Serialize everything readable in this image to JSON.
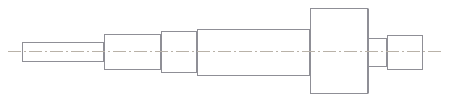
{
  "drawing": {
    "title": "Stepped Shaft",
    "view": "side-elevation",
    "projection": "orthographic",
    "units": "px",
    "canvas": {
      "width": 451,
      "height": 101
    },
    "style": {
      "background": "#ffffff",
      "outline_color": "#8f8f96",
      "centerline_color": "#b9b2a8",
      "line_width": 1,
      "centerline_dash": "13 3 2 3"
    },
    "centerline": {
      "label": "axis-of-revolution",
      "y": 51,
      "x_start": 8,
      "x_end": 441
    },
    "sections": [
      {
        "index": 1,
        "name": "left-end-journal",
        "x_start": 22,
        "x_end": 104,
        "y_top": 42,
        "y_bottom": 62,
        "length": 82,
        "diameter": 20
      },
      {
        "index": 2,
        "name": "second-step",
        "x_start": 104,
        "x_end": 161,
        "y_top": 34,
        "y_bottom": 70,
        "length": 57,
        "diameter": 36
      },
      {
        "index": 3,
        "name": "short-collar-step",
        "x_start": 161,
        "x_end": 197,
        "y_top": 31,
        "y_bottom": 73,
        "length": 36,
        "diameter": 42
      },
      {
        "index": 4,
        "name": "main-body",
        "x_start": 197,
        "x_end": 310,
        "y_top": 29,
        "y_bottom": 76,
        "length": 113,
        "diameter": 47
      },
      {
        "index": 5,
        "name": "large-flange",
        "x_start": 310,
        "x_end": 368,
        "y_top": 8,
        "y_bottom": 94,
        "length": 58,
        "diameter": 86
      },
      {
        "index": 6,
        "name": "flange-shoulder",
        "x_start": 368,
        "x_end": 387,
        "y_top": 38,
        "y_bottom": 67,
        "length": 19,
        "diameter": 29
      },
      {
        "index": 7,
        "name": "right-end-journal",
        "x_start": 387,
        "x_end": 423,
        "y_top": 35,
        "y_bottom": 70,
        "length": 36,
        "diameter": 35
      }
    ]
  }
}
